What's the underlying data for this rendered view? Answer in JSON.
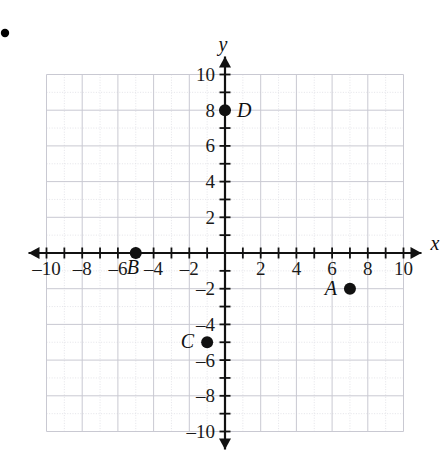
{
  "figure": {
    "corner_mark": "•"
  },
  "chart_data": {
    "type": "scatter",
    "title": "",
    "xlabel": "x",
    "ylabel": "y",
    "xlim": [
      -10,
      10
    ],
    "ylim": [
      -10,
      10
    ],
    "grid": true,
    "grid_minor_step": 1,
    "grid_major_step": 2,
    "tick_step": 1,
    "tick_label_step": 2,
    "legend": "none",
    "x_tick_labels": [
      "-10",
      "-8",
      "-6",
      "-4",
      "-2",
      "2",
      "4",
      "6",
      "8",
      "10"
    ],
    "x_tick_values": [
      -10,
      -8,
      -6,
      -4,
      -2,
      2,
      4,
      6,
      8,
      10
    ],
    "y_tick_labels": [
      "10",
      "8",
      "6",
      "4",
      "2",
      "-2",
      "-4",
      "-6",
      "-8",
      "-10"
    ],
    "y_tick_values": [
      10,
      8,
      6,
      4,
      2,
      -2,
      -4,
      -6,
      -8,
      -10
    ],
    "points": [
      {
        "label": "A",
        "x": 7,
        "y": -2,
        "label_side": "left"
      },
      {
        "label": "B",
        "x": -5,
        "y": 0,
        "label_side": "below-left"
      },
      {
        "label": "C",
        "x": -1,
        "y": -5,
        "label_side": "left"
      },
      {
        "label": "D",
        "x": 0,
        "y": 8,
        "label_side": "right"
      }
    ]
  },
  "style": {
    "axis_color": "#111111",
    "grid_minor_color": "#dddde3",
    "grid_major_color": "#c9c9d2",
    "point_color": "#111111",
    "background": "#ffffff"
  }
}
